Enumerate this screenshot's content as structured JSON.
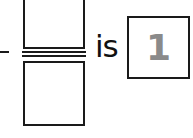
{
  "expression": {
    "numerator": "",
    "denominator": "",
    "connector_text": "is",
    "answer": "1"
  },
  "colors": {
    "ink": "#1a1a1a",
    "answer_gray": "#8a8a8a"
  }
}
